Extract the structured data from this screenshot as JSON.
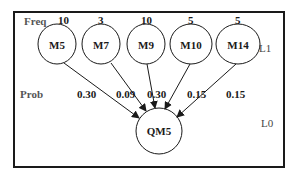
{
  "labels": {
    "freq": "Freq",
    "prob": "Prob",
    "level1": "L1",
    "level0": "L0"
  },
  "sources": [
    {
      "name": "M5",
      "freq": "10",
      "prob": "0.30"
    },
    {
      "name": "M7",
      "freq": "3",
      "prob": "0.09"
    },
    {
      "name": "M9",
      "freq": "10",
      "prob": "0.30"
    },
    {
      "name": "M10",
      "freq": "5",
      "prob": "0.15"
    },
    {
      "name": "M14",
      "freq": "5",
      "prob": "0.15"
    }
  ],
  "target": {
    "name": "QM5"
  },
  "colors": {
    "line": "#1a1a1a",
    "background": "#ffffff"
  }
}
